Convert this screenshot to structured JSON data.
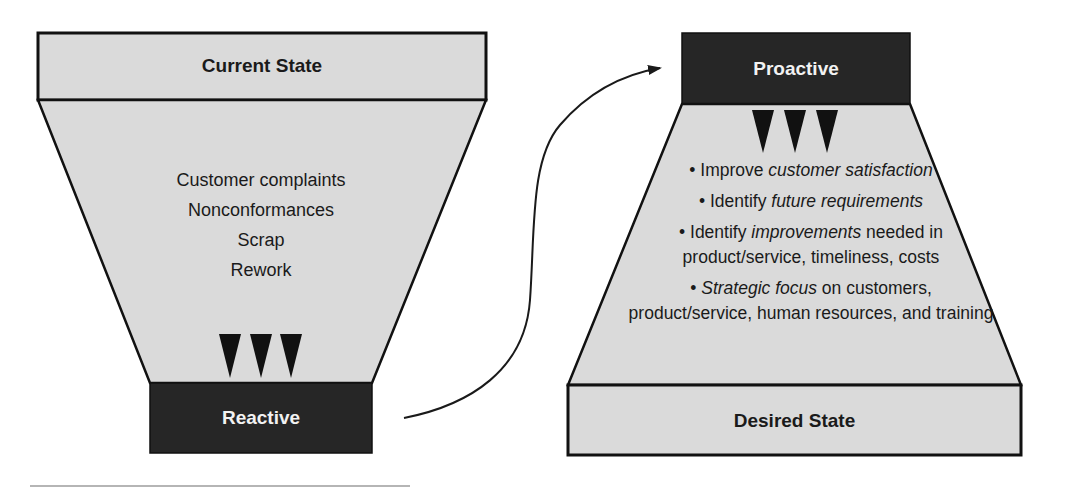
{
  "colors": {
    "light_fill": "#d9d9d9",
    "dark_fill": "#262626",
    "stroke": "#111111",
    "arrow": "#1a1a1a"
  },
  "left_funnel": {
    "top_label": "Current State",
    "bottom_label": "Reactive",
    "items": [
      "Customer complaints",
      "Nonconformances",
      "Scrap",
      "Rework"
    ],
    "indicator": "three-down-triangles"
  },
  "right_funnel": {
    "top_label": "Proactive",
    "bottom_label": "Desired State",
    "indicator": "three-down-triangles",
    "bullets": [
      {
        "pre": "Improve ",
        "em": "customer satisfaction",
        "post": ""
      },
      {
        "pre": "Identify ",
        "em": "future requirements",
        "post": ""
      },
      {
        "pre": "Identify ",
        "em": "improvements",
        "post": " needed in product/service, timeliness, costs"
      },
      {
        "pre": "",
        "em": "Strategic focus",
        "post": " on customers, product/service, human resources, and training"
      }
    ]
  },
  "connector": {
    "from": "Reactive",
    "to": "Proactive",
    "type": "curved-arrow"
  }
}
